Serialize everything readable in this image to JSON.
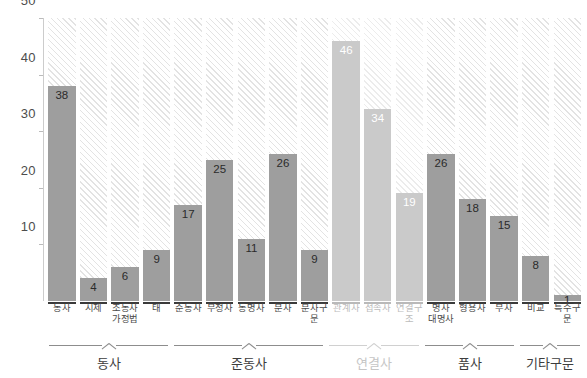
{
  "chart_data": {
    "type": "bar",
    "title": "",
    "xlabel": "",
    "ylabel": "",
    "ylim": [
      0,
      50
    ],
    "yticks": [
      10,
      20,
      30,
      40,
      50
    ],
    "grid": false,
    "legend": null,
    "note": "Each column shows a solid filled bar against a hatched track spanning the full 0-50 axis range",
    "categories": [
      "동사",
      "시제",
      "조동사\n가정법",
      "태",
      "준동사",
      "부정사",
      "동명사",
      "분사",
      "분사구문",
      "관계사",
      "접속사",
      "연결구조",
      "명사\n대명사",
      "형용사",
      "부사",
      "비교",
      "특수구문"
    ],
    "values": [
      38,
      4,
      6,
      9,
      17,
      25,
      11,
      26,
      9,
      46,
      34,
      19,
      26,
      18,
      15,
      8,
      1
    ],
    "groups": [
      {
        "label": "동사",
        "categories": [
          "동사",
          "시제",
          "조동사\n가정법",
          "태"
        ],
        "values": [
          38,
          4,
          6,
          9
        ],
        "highlight": "normal"
      },
      {
        "label": "준동사",
        "categories": [
          "준동사",
          "부정사",
          "동명사",
          "분사",
          "분사구문"
        ],
        "values": [
          17,
          25,
          11,
          26,
          9
        ],
        "highlight": "normal"
      },
      {
        "label": "연결사",
        "categories": [
          "관계사",
          "접속사",
          "연결구조"
        ],
        "values": [
          46,
          34,
          19
        ],
        "highlight": "dimmed"
      },
      {
        "label": "품사",
        "categories": [
          "명사\n대명사",
          "형용사",
          "부사"
        ],
        "values": [
          26,
          18,
          15
        ],
        "highlight": "normal"
      },
      {
        "label": "기타구문",
        "categories": [
          "비교",
          "특수구문"
        ],
        "values": [
          8,
          1
        ],
        "highlight": "normal"
      }
    ],
    "colors": {
      "bar_fill": "#9e9e9e",
      "bar_fill_dimmed": "#cacaca",
      "hatch": "#e3e3e3",
      "hatch_dimmed": "#ececec",
      "axis_text": "#4d4d4d",
      "label_text": "#4a4a4a",
      "label_text_dimmed": "#bcbcbc",
      "baseline": "#3a3a3a",
      "baseline_dimmed": "#b9b9b9",
      "value_label": "#2b2b2b",
      "value_label_on_dimmed": "#ffffff"
    }
  },
  "yaxis": {
    "t50": "50",
    "t40": "40",
    "t30": "30",
    "t20": "20",
    "t10": "10"
  },
  "bars": [
    {
      "cat": "동사",
      "val": "38",
      "line2": ""
    },
    {
      "cat": "시제",
      "val": "4",
      "line2": ""
    },
    {
      "cat": "조동사",
      "val": "6",
      "line2": "가정법"
    },
    {
      "cat": "태",
      "val": "9",
      "line2": ""
    },
    {
      "cat": "준동사",
      "val": "17",
      "line2": ""
    },
    {
      "cat": "부정사",
      "val": "25",
      "line2": ""
    },
    {
      "cat": "동명사",
      "val": "11",
      "line2": ""
    },
    {
      "cat": "분사",
      "val": "26",
      "line2": ""
    },
    {
      "cat": "분사구문",
      "val": "9",
      "line2": ""
    },
    {
      "cat": "관계사",
      "val": "46",
      "line2": ""
    },
    {
      "cat": "접속사",
      "val": "34",
      "line2": ""
    },
    {
      "cat": "연결구조",
      "val": "19",
      "line2": ""
    },
    {
      "cat": "명사",
      "val": "26",
      "line2": "대명사"
    },
    {
      "cat": "형용사",
      "val": "18",
      "line2": ""
    },
    {
      "cat": "부사",
      "val": "15",
      "line2": ""
    },
    {
      "cat": "비교",
      "val": "8",
      "line2": ""
    },
    {
      "cat": "특수구문",
      "val": "1",
      "line2": ""
    }
  ],
  "groups": [
    {
      "label": "동사"
    },
    {
      "label": "준동사"
    },
    {
      "label": "연결사"
    },
    {
      "label": "품사"
    },
    {
      "label": "기타구문"
    }
  ]
}
